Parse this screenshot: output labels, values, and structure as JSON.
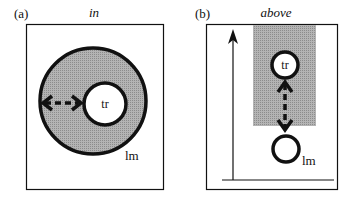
{
  "panels": [
    {
      "tag": "(a)",
      "title": "in",
      "trajector_label": "tr",
      "landmark_label": "lm"
    },
    {
      "tag": "(b)",
      "title": "above",
      "trajector_label": "tr",
      "landmark_label": "lm"
    }
  ],
  "colors": {
    "region_fill": "#a8a8a8",
    "stroke": "#111111",
    "background": "#ffffff"
  }
}
